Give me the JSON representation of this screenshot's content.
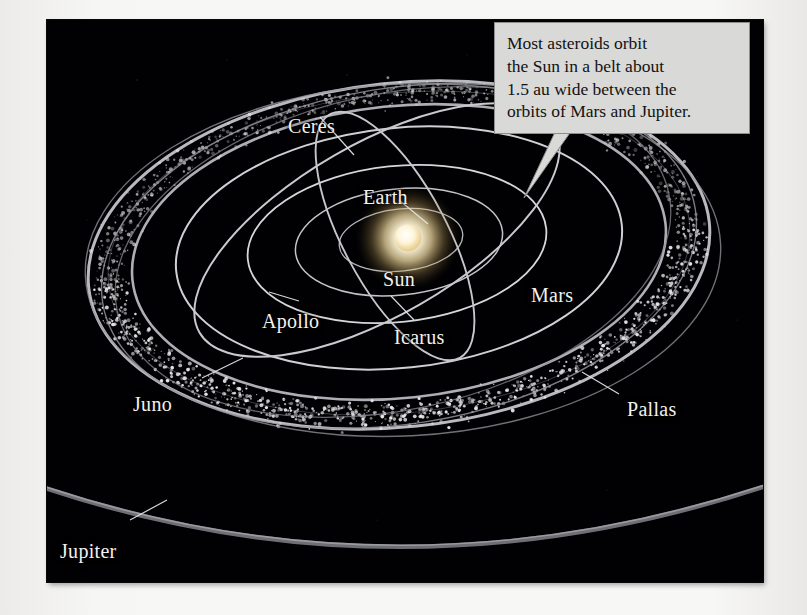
{
  "figure": {
    "kind": "astronomy-diagram",
    "background_color": "#010103",
    "page_color": "#f4f4f2",
    "label_color": "#f3f2ee"
  },
  "callout": {
    "name": "asteroid-belt-callout",
    "background_color": "#d9d9d7",
    "border_color": "#8d8d8b",
    "text_color": "#121212",
    "lines": [
      "Most asteroids orbit",
      "the Sun in a belt about",
      "1.5 au wide between the",
      "orbits of Mars and Jupiter."
    ],
    "full_text": "Most asteroids orbit the Sun in a belt about 1.5 au wide between the orbits of Mars and Jupiter."
  },
  "labels": [
    {
      "id": "ceres",
      "text": "Ceres",
      "x": 288,
      "y": 102,
      "leader": true
    },
    {
      "id": "earth",
      "text": "Earth",
      "x": 363,
      "y": 172,
      "leader": true
    },
    {
      "id": "sun",
      "text": "Sun",
      "x": 383,
      "y": 255,
      "leader": false
    },
    {
      "id": "mars",
      "text": "Mars",
      "x": 531,
      "y": 271,
      "leader": false
    },
    {
      "id": "apollo",
      "text": "Apollo",
      "x": 262,
      "y": 297,
      "leader": true
    },
    {
      "id": "icarus",
      "text": "Icarus",
      "x": 394,
      "y": 313,
      "leader": true
    },
    {
      "id": "juno",
      "text": "Juno",
      "x": 133,
      "y": 380,
      "leader": true
    },
    {
      "id": "pallas",
      "text": "Pallas",
      "x": 627,
      "y": 385,
      "leader": true
    },
    {
      "id": "jupiter",
      "text": "Jupiter",
      "x": 60,
      "y": 527,
      "leader": true
    }
  ],
  "chart_data": {
    "type": "scatter",
    "center_body": "Sun",
    "belt_width_au": 1.5,
    "belt_between": [
      "Mars",
      "Jupiter"
    ],
    "named_orbits": [
      "Earth",
      "Mars",
      "Jupiter",
      "Ceres",
      "Pallas",
      "Juno",
      "Apollo",
      "Icarus"
    ],
    "legend": "none",
    "grid": false
  },
  "sun": {
    "name": "sun-body",
    "core_color": "#ffffff",
    "glow_color": "#ffe9b0",
    "cx": 408,
    "cy": 238,
    "r": 15
  }
}
